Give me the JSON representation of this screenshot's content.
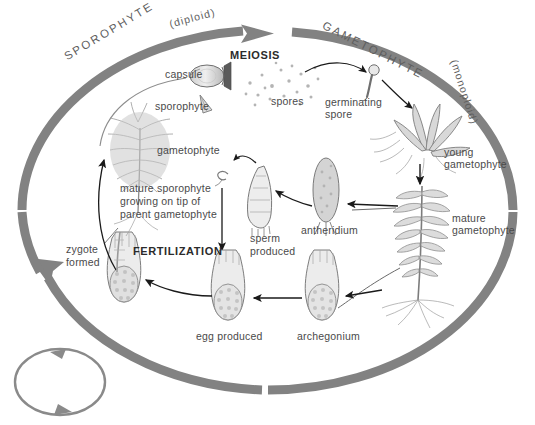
{
  "figure": {
    "kind": "moss-life-cycle-diagram",
    "background_color": "#ffffff",
    "band_color": "#808080",
    "ink_color": "#4a4a4a"
  },
  "phases": {
    "sporophyte": {
      "name": "SPOROPHYTE",
      "ploidy": "(diploid)"
    },
    "gametophyte": {
      "name": "GAMETOPHYTE",
      "ploidy": "(monoploid)"
    }
  },
  "processes": {
    "meiosis": "MEIOSIS",
    "fertilization": "FERTILIZATION"
  },
  "labels": {
    "capsule": "capsule",
    "sporophyte": "sporophyte",
    "gametophyte": "gametophyte",
    "spores": "spores",
    "germinating_spore_line1": "germinating",
    "germinating_spore_line2": "spore",
    "young_gametophyte_line1": "young",
    "young_gametophyte_line2": "gametophyte",
    "mature_gametophyte_line1": "mature",
    "mature_gametophyte_line2": "gametophyte",
    "mature_sporophyte_line1": "mature sporophyte",
    "mature_sporophyte_line2": "growing on tip of",
    "mature_sporophyte_line3": "parent gametophyte",
    "zygote_line1": "zygote",
    "zygote_line2": "formed",
    "sperm_line1": "sperm",
    "sperm_line2": "produced",
    "antheridium": "antheridium",
    "egg_produced": "egg produced",
    "archegonium": "archegonium"
  },
  "cycle_icon": {
    "name": "cycle-loop-icon"
  }
}
